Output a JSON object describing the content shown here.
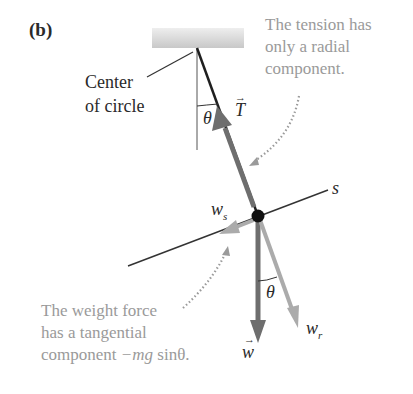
{
  "figure": {
    "panel_label": "(b)",
    "center_label": [
      "Center",
      "of circle"
    ],
    "tension_note": [
      "The tension has",
      "only a radial",
      "component."
    ],
    "weight_note": [
      "The weight force",
      "has a tangential",
      "component "
    ],
    "weight_note_math": "−mg",
    "weight_note_tail": " sinθ.",
    "symbols": {
      "tension": "T",
      "weight": "w",
      "w_s": "w",
      "w_s_sub": "s",
      "w_r": "w",
      "w_r_sub": "r",
      "theta_top": "θ",
      "theta_bottom": "θ",
      "s_axis": "s",
      "vec_arrow": "→"
    },
    "colors": {
      "tension_arrow": "#6e6e6e",
      "weight_arrow": "#6e6e6e",
      "component_arrows": "#ababab",
      "string": "#1f1f1f",
      "note_text": "#9a9a9a",
      "ceiling": "#cfcfcf"
    }
  }
}
